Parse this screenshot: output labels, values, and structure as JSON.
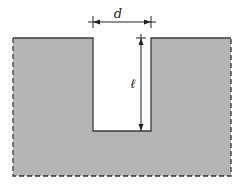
{
  "diagram": {
    "type": "slot-cross-section",
    "labels": {
      "width": "d",
      "depth": "ℓ"
    },
    "colors": {
      "material": "#b4b4b4",
      "outline": "#3a3a3a",
      "background": "#ffffff"
    }
  }
}
